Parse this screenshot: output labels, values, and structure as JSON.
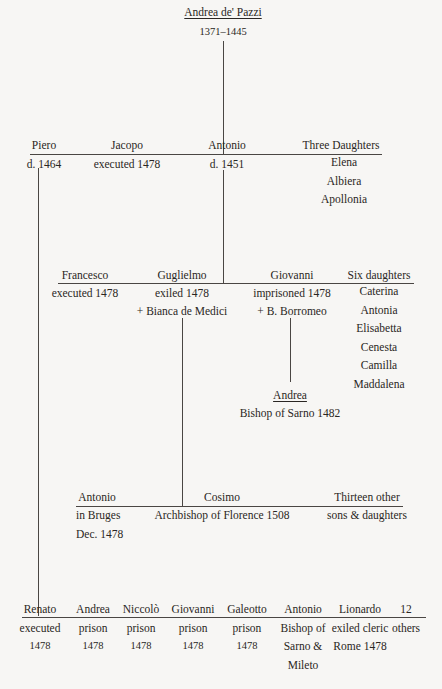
{
  "root": {
    "name": "Andrea de' Pazzi",
    "dates": "1371–1445"
  },
  "generation2": [
    {
      "name": "Piero",
      "note": "d. 1464"
    },
    {
      "name": "Jacopo",
      "note": "executed 1478"
    },
    {
      "name": "Antonio",
      "note": "d. 1451"
    },
    {
      "name": "Three Daughters",
      "children": [
        "Elena",
        "Albiera",
        "Apollonia"
      ]
    }
  ],
  "generation3": [
    {
      "name": "Francesco",
      "note": "executed 1478"
    },
    {
      "name": "Guglielmo",
      "note": "exiled 1478",
      "spouse": "+ Bianca de Medici"
    },
    {
      "name": "Giovanni",
      "note": "imprisoned 1478",
      "spouse": "+ B. Borromeo"
    },
    {
      "name": "Six daughters",
      "children": [
        "Caterina",
        "Antonia",
        "Elisabetta",
        "Cenesta",
        "Camilla",
        "Maddalena"
      ]
    }
  ],
  "giovanni_child": {
    "name": "Andrea",
    "note": "Bishop of Sarno 1482"
  },
  "generation4": [
    {
      "name": "Antonio",
      "note": "in Bruges",
      "note2": "Dec. 1478"
    },
    {
      "name": "Cosimo",
      "note": "Archbishop of Florence 1508"
    },
    {
      "name": "Thirteen other",
      "note": "sons & daughters"
    }
  ],
  "generation5": [
    {
      "name": "Renato",
      "lines": [
        "executed",
        "1478"
      ]
    },
    {
      "name": "Andrea",
      "lines": [
        "prison",
        "1478"
      ]
    },
    {
      "name": "Niccolò",
      "lines": [
        "prison",
        "1478"
      ]
    },
    {
      "name": "Giovanni",
      "lines": [
        "prison",
        "1478"
      ]
    },
    {
      "name": "Galeotto",
      "lines": [
        "prison",
        "1478"
      ]
    },
    {
      "name": "Antonio",
      "lines": [
        "Bishop of",
        "Sarno &",
        "Mileto"
      ]
    },
    {
      "name": "Lionardo",
      "lines": [
        "exiled cleric",
        "Rome 1478"
      ]
    },
    {
      "name": "12 others",
      "lines": []
    }
  ]
}
